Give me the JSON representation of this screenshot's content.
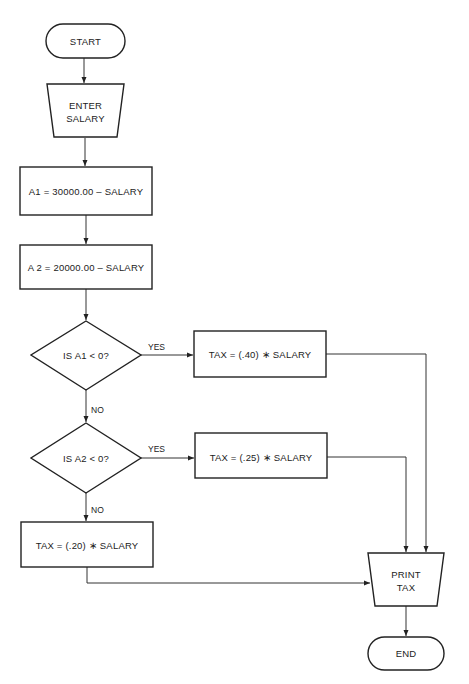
{
  "diagram": {
    "type": "flowchart",
    "nodes": {
      "start": {
        "shape": "terminal",
        "label": "START"
      },
      "enter_salary": {
        "shape": "manual-input",
        "line1": "ENTER",
        "line2": "SALARY"
      },
      "calc_a1": {
        "shape": "process",
        "label": "A1 = 30000.00 – SALARY"
      },
      "calc_a2": {
        "shape": "process",
        "label": "A 2 = 20000.00 – SALARY"
      },
      "decision_a1": {
        "shape": "decision",
        "label": "IS A1 < 0?"
      },
      "decision_a2": {
        "shape": "decision",
        "label": "IS A2 < 0?"
      },
      "tax_40": {
        "shape": "process",
        "label": "TAX = (.40) ∗ SALARY"
      },
      "tax_25": {
        "shape": "process",
        "label": "TAX = (.25) ∗ SALARY"
      },
      "tax_20": {
        "shape": "process",
        "label": "TAX = (.20) ∗ SALARY"
      },
      "print_tax": {
        "shape": "manual-input",
        "line1": "PRINT",
        "line2": "TAX"
      },
      "end": {
        "shape": "terminal",
        "label": "END"
      }
    },
    "edges": [
      {
        "from": "start",
        "to": "enter_salary",
        "label": ""
      },
      {
        "from": "enter_salary",
        "to": "calc_a1",
        "label": ""
      },
      {
        "from": "calc_a1",
        "to": "calc_a2",
        "label": ""
      },
      {
        "from": "calc_a2",
        "to": "decision_a1",
        "label": ""
      },
      {
        "from": "decision_a1",
        "to": "tax_40",
        "label": "YES"
      },
      {
        "from": "decision_a1",
        "to": "decision_a2",
        "label": "NO"
      },
      {
        "from": "decision_a2",
        "to": "tax_25",
        "label": "YES"
      },
      {
        "from": "decision_a2",
        "to": "tax_20",
        "label": "NO"
      },
      {
        "from": "tax_40",
        "to": "print_tax",
        "label": ""
      },
      {
        "from": "tax_25",
        "to": "print_tax",
        "label": ""
      },
      {
        "from": "tax_20",
        "to": "print_tax",
        "label": ""
      },
      {
        "from": "print_tax",
        "to": "end",
        "label": ""
      }
    ],
    "edge_labels": {
      "d1_yes": "YES",
      "d1_no": "NO",
      "d2_yes": "YES",
      "d2_no": "NO"
    },
    "colors": {
      "stroke": "#222222",
      "background": "#ffffff"
    }
  }
}
